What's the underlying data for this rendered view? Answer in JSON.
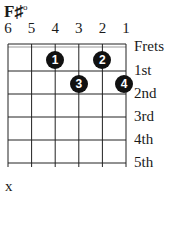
{
  "chord": {
    "name": "F♯",
    "quality": "o"
  },
  "strings": [
    "6",
    "5",
    "4",
    "3",
    "2",
    "1"
  ],
  "fret_labels": [
    "Frets",
    "1st",
    "2nd",
    "3rd",
    "4th",
    "5th"
  ],
  "fingers": [
    {
      "finger": "1",
      "string": 4,
      "fret": 1
    },
    {
      "finger": "2",
      "string": 2,
      "fret": 1
    },
    {
      "finger": "3",
      "string": 3,
      "fret": 2
    },
    {
      "finger": "4",
      "string": 1,
      "fret": 2
    }
  ],
  "muted": {
    "string": 6,
    "symbol": "x"
  }
}
